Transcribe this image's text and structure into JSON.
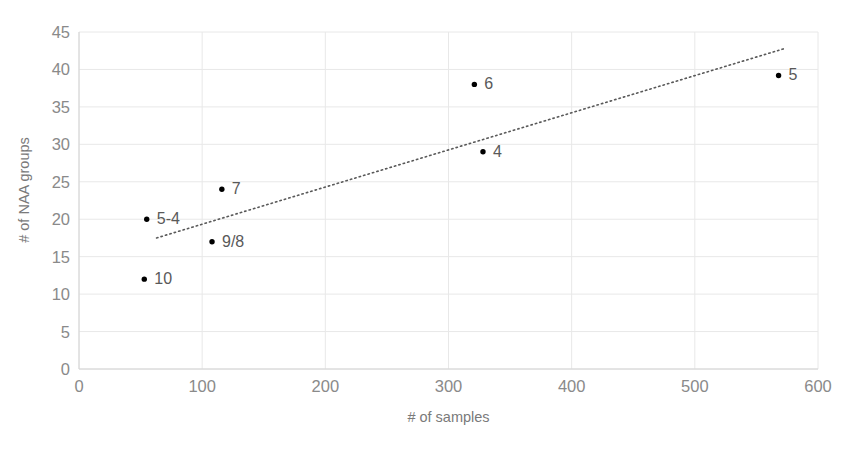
{
  "chart_data": {
    "type": "scatter",
    "title": "",
    "xlabel": "# of samples",
    "ylabel": "# of NAA groups",
    "xlim": [
      0,
      600
    ],
    "ylim": [
      0,
      45
    ],
    "xticks": [
      0,
      100,
      200,
      300,
      400,
      500,
      600
    ],
    "yticks": [
      0,
      5,
      10,
      15,
      20,
      25,
      30,
      35,
      40,
      45
    ],
    "grid": true,
    "legend": "none",
    "marker_color": "#000000",
    "label_color": "#595959",
    "gridline_color": "#e8e8e8",
    "trendline": {
      "style": "dotted",
      "color": "#595959",
      "x_start": 63,
      "y_start": 17.5,
      "x_end": 573,
      "y_end": 42.8
    },
    "points": [
      {
        "label": "10",
        "x": 53,
        "y": 12.0,
        "label_dx": 10,
        "label_dy": 0
      },
      {
        "label": "5-4",
        "x": 55,
        "y": 20.0,
        "label_dx": 10,
        "label_dy": 0
      },
      {
        "label": "9/8",
        "x": 108,
        "y": 17.0,
        "label_dx": 10,
        "label_dy": 0
      },
      {
        "label": "7",
        "x": 116,
        "y": 24.0,
        "label_dx": 10,
        "label_dy": 0
      },
      {
        "label": "6",
        "x": 321,
        "y": 38.0,
        "label_dx": 10,
        "label_dy": 0
      },
      {
        "label": "4",
        "x": 328,
        "y": 29.0,
        "label_dx": 10,
        "label_dy": 0
      },
      {
        "label": "5",
        "x": 568,
        "y": 39.2,
        "label_dx": 10,
        "label_dy": 0
      }
    ]
  }
}
